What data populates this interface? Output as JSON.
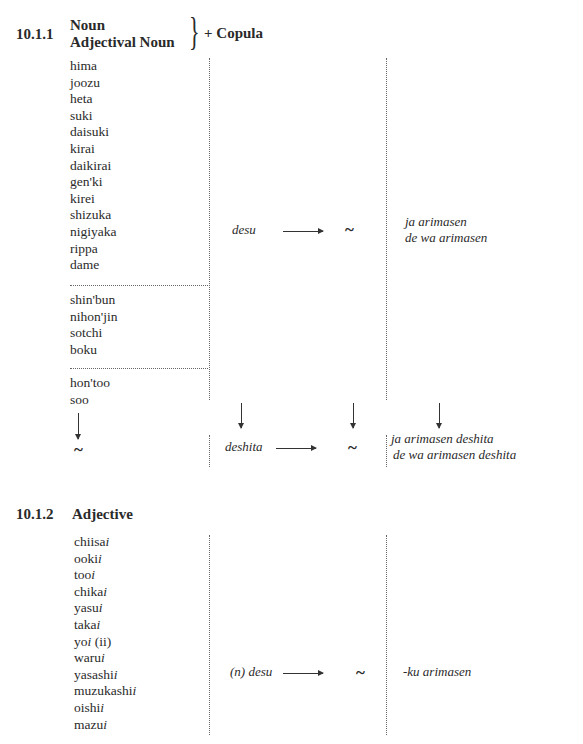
{
  "section1": {
    "number": "10.1.1",
    "title_line1": "Noun",
    "title_line2": "Adjectival Noun",
    "brace": "}",
    "suffix": "+ Copula",
    "group_adjectival_nouns": [
      "hima",
      "joozu",
      "heta",
      "suki",
      "daisuki",
      "kirai",
      "daikirai",
      "gen'ki",
      "kirei",
      "shizuka",
      "nigiyaka",
      "rippa",
      "dame"
    ],
    "group_nouns": [
      "shin'bun",
      "nihon'jin",
      "sotchi",
      "boku"
    ],
    "group_other": [
      "hon'too",
      "soo"
    ],
    "present_form": "desu",
    "tilde": "~",
    "present_negative": [
      "ja arimasen",
      "de wa arimasen"
    ],
    "past_form": "deshita",
    "past_negative": [
      "ja arimasen deshita",
      "de wa arimasen deshita"
    ]
  },
  "section2": {
    "number": "10.1.2",
    "title": "Adjective",
    "items": [
      "chiisai",
      "ookii",
      "tooi",
      "chikai",
      "yasui",
      "takai",
      "yoi (ii)",
      "warui",
      "yasashii",
      "muzukashii",
      "oishii",
      "mazui"
    ],
    "items_stem": [
      "chiisa",
      "ooki",
      "too",
      "chika",
      "yasu",
      "taka",
      "yo",
      "waru",
      "yasashi",
      "muzukashi",
      "oishi",
      "mazu"
    ],
    "items_ending": [
      "i",
      "i",
      "i",
      "i",
      "i",
      "i",
      "i",
      "i",
      "i",
      "i",
      "i",
      "i"
    ],
    "items_extra": [
      "",
      "",
      "",
      "",
      "",
      "",
      " (ii)",
      "",
      "",
      "",
      "",
      ""
    ],
    "present_form": "(n) desu",
    "tilde": "~",
    "negative": "-ku arimasen"
  }
}
